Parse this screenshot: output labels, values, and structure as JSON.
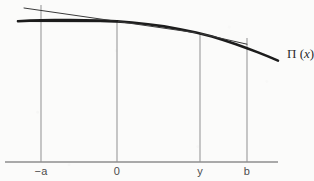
{
  "figure": {
    "curve_label_symbol": "Π",
    "curve_label_open": " (",
    "curve_label_variable": "x",
    "curve_label_close": ")",
    "background_color": "#fbfbfa",
    "curve_color": "#1c1c1c",
    "tangent_color": "#3a3a3a",
    "axis_color": "#8e8e8e",
    "gridline_color": "#9a9a9a"
  },
  "axis": {
    "name": "x-axis",
    "y_pixel": 162,
    "x_start": 5,
    "x_end": 278,
    "ticks": [
      {
        "label": "−a",
        "x": 41,
        "label_y": 165,
        "line_top": 5
      },
      {
        "label": "0",
        "x": 117,
        "label_y": 165,
        "line_top": 21
      },
      {
        "label": "y",
        "x": 200,
        "label_y": 165,
        "line_top": 33
      },
      {
        "label": "b",
        "x": 247,
        "label_y": 165,
        "line_top": 38
      }
    ]
  },
  "chart_data": {
    "type": "line",
    "title": "",
    "xlabel": "",
    "ylabel": "",
    "grid": false,
    "legend": "none",
    "xlim": [
      5,
      290
    ],
    "ylim": [
      0,
      181
    ],
    "annotations": [
      {
        "text": "Π (x)",
        "x": 287,
        "y": 52,
        "role": "curve-label"
      }
    ],
    "series": [
      {
        "name": "Π(x) profit curve",
        "role": "curve",
        "stroke_width": 2.6,
        "points": [
          [
            18,
            21.2
          ],
          [
            30,
            20.6
          ],
          [
            41,
            20.3
          ],
          [
            55,
            20.0
          ],
          [
            70,
            20.0
          ],
          [
            85,
            20.2
          ],
          [
            100,
            20.6
          ],
          [
            117,
            21.4
          ],
          [
            132,
            22.5
          ],
          [
            148,
            24.2
          ],
          [
            164,
            26.4
          ],
          [
            180,
            29.2
          ],
          [
            196,
            32.6
          ],
          [
            200,
            33.5
          ],
          [
            212,
            36.6
          ],
          [
            224,
            40.2
          ],
          [
            236,
            44.2
          ],
          [
            247,
            48.2
          ],
          [
            258,
            52.4
          ],
          [
            268,
            56.4
          ],
          [
            278,
            60.6
          ]
        ]
      },
      {
        "name": "tangent line at 0",
        "role": "tangent",
        "stroke_width": 1.0,
        "points": [
          [
            24,
            8.0
          ],
          [
            117,
            21.4
          ],
          [
            196,
            32.8
          ]
        ]
      },
      {
        "name": "chord at -a",
        "role": "chord",
        "stroke_width": 1.8,
        "points": [
          [
            18,
            21.0
          ],
          [
            117,
            21.4
          ]
        ]
      },
      {
        "name": "tangent line at y",
        "role": "tangent",
        "stroke_width": 1.0,
        "points": [
          [
            200,
            33.5
          ],
          [
            247,
            44.2
          ]
        ]
      }
    ]
  }
}
